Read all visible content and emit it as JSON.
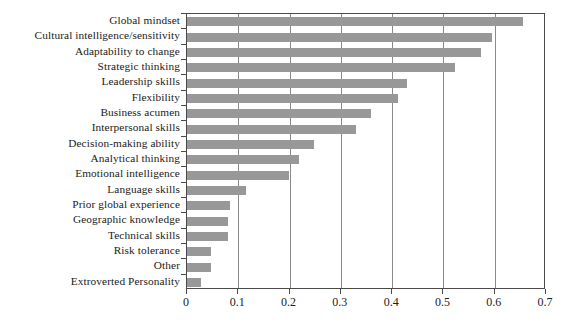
{
  "chart_data": {
    "type": "bar",
    "orientation": "horizontal",
    "title": "",
    "subtitle": "",
    "xlabel": "",
    "ylabel": "",
    "xlim": [
      0,
      0.7
    ],
    "xticks": [
      "0",
      "0.1",
      "0.2",
      "0.3",
      "0.4",
      "0.5",
      "0.6",
      "0.7"
    ],
    "xtick_values": [
      0,
      0.1,
      0.2,
      0.3,
      0.4,
      0.5,
      0.6,
      0.7
    ],
    "grid": "vertical",
    "legend": "none",
    "bar_color": "#989898",
    "axis_color": "#4a4a4a",
    "categories": [
      "Global mindset",
      "Cultural intelligence/sensitivity",
      "Adaptability to change",
      "Strategic thinking",
      "Leadership skills",
      "Flexibility",
      "Business acumen",
      "Interpersonal skills",
      "Decision-making ability",
      "Analytical thinking",
      "Emotional intelligence",
      "Language skills",
      "Prior global experience",
      "Geographic knowledge",
      "Technical skills",
      "Risk tolerance",
      "Other",
      "Extroverted Personality"
    ],
    "values": [
      0.655,
      0.595,
      0.573,
      0.523,
      0.428,
      0.411,
      0.358,
      0.329,
      0.248,
      0.219,
      0.198,
      0.115,
      0.084,
      0.079,
      0.079,
      0.047,
      0.047,
      0.027
    ]
  }
}
